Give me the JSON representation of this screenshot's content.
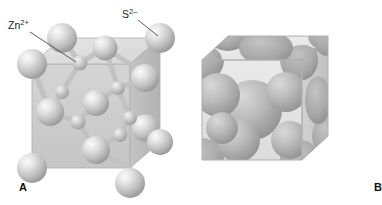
{
  "figure": {
    "panels": [
      {
        "id": "A",
        "letter": "A",
        "name": "ball-and-stick-model",
        "description": "Ball-and-stick model of the zinc blende unit cell"
      },
      {
        "id": "B",
        "letter": "B",
        "name": "space-filling-model",
        "description": "Space-filling model of the zinc blende unit cell"
      }
    ],
    "labels": {
      "cation": {
        "symbol": "Zn",
        "charge": "2+",
        "text": "Zn2+"
      },
      "anion": {
        "symbol": "S",
        "charge": "2–",
        "text": "S2–"
      }
    },
    "colors": {
      "background": "#ffffff",
      "sphere_light": "#f2f2f2",
      "sphere_mid": "#b9b9b9",
      "sphere_dark": "#8e8e8e",
      "cube_face_front": "#c9c9c9",
      "cube_face_top": "#dedede",
      "cube_face_side": "#b3b3b3",
      "cube_edge": "#9a9a9a",
      "bond": "#bdbdbd",
      "leader_line": "#4a4a4a",
      "text": "#1a1a1a",
      "cut_sphere_fill": "#a8a8a8"
    }
  }
}
